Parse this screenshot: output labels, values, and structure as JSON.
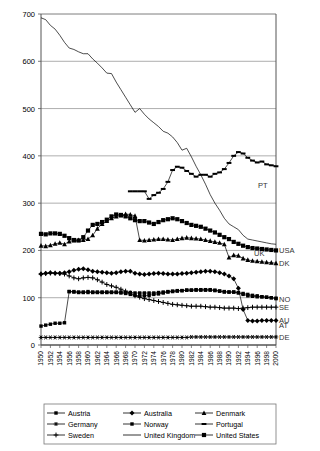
{
  "chart_data": {
    "type": "line",
    "title": "",
    "xlabel": "",
    "ylabel": "",
    "xlim": [
      1950,
      2000
    ],
    "ylim": [
      0,
      700
    ],
    "yticks": [
      0,
      100,
      200,
      300,
      400,
      500,
      600,
      700
    ],
    "ytick_labels": [
      "0",
      "100",
      "200",
      "300",
      "400",
      "500",
      "600",
      "700"
    ],
    "grid": "horizontal",
    "legend_position": "bottom",
    "xticks": [
      1950,
      1952,
      1954,
      1956,
      1958,
      1960,
      1962,
      1964,
      1966,
      1968,
      1970,
      1972,
      1974,
      1976,
      1978,
      1980,
      1982,
      1984,
      1986,
      1988,
      1990,
      1992,
      1994,
      1996,
      1998,
      2000
    ],
    "xtick_labels": [
      "1950",
      "1952",
      "1954",
      "1956",
      "1958",
      "1960",
      "1962",
      "1964",
      "1966",
      "1968",
      "1970",
      "1972",
      "1974",
      "1976",
      "1978",
      "1980",
      "1982",
      "1984",
      "1986",
      "1988",
      "1990",
      "1992",
      "1994",
      "1996",
      "1998",
      "2000"
    ],
    "x": [
      1950,
      1951,
      1952,
      1953,
      1954,
      1955,
      1956,
      1957,
      1958,
      1959,
      1960,
      1961,
      1962,
      1963,
      1964,
      1965,
      1966,
      1967,
      1968,
      1969,
      1970,
      1971,
      1972,
      1973,
      1974,
      1975,
      1976,
      1977,
      1978,
      1979,
      1980,
      1981,
      1982,
      1983,
      1984,
      1985,
      1986,
      1987,
      1988,
      1989,
      1990,
      1991,
      1992,
      1993,
      1994,
      1995,
      1996,
      1997,
      1998,
      1999,
      2000
    ],
    "end_labels": [
      {
        "code": "PT",
        "series": "Portugal",
        "value": 378
      },
      {
        "code": "UK",
        "series": "United Kingdom",
        "value": 213
      },
      {
        "code": "USA",
        "series": "United States",
        "value": 200
      },
      {
        "code": "DK",
        "series": "Denmark",
        "value": 173
      },
      {
        "code": "NO",
        "series": "Norway",
        "value": 98
      },
      {
        "code": "SE",
        "series": "Sweden",
        "value": 80
      },
      {
        "code": "AU",
        "series": "Australia",
        "value": 52
      },
      {
        "code": "AT",
        "series": "Austria",
        "value": 43
      },
      {
        "code": "DE",
        "series": "Germany",
        "value": 17
      }
    ],
    "series": [
      {
        "name": "Austria",
        "code": "AT",
        "marker": "square-small",
        "values": [
          40,
          42,
          44,
          46,
          46,
          47,
          113,
          113,
          112,
          112,
          113,
          112,
          112,
          112,
          112,
          112,
          112,
          112,
          111,
          111,
          110,
          110,
          110,
          110,
          110,
          111,
          112,
          113,
          114,
          115,
          115,
          116,
          116,
          116,
          116,
          116,
          116,
          115,
          114,
          113,
          112,
          112,
          110,
          107,
          104,
          103,
          102,
          102,
          101,
          100,
          99
        ]
      },
      {
        "name": "Australia",
        "code": "AU",
        "marker": "diamond",
        "values": [
          150,
          152,
          153,
          152,
          152,
          153,
          155,
          158,
          160,
          161,
          159,
          156,
          155,
          154,
          153,
          152,
          153,
          155,
          156,
          156,
          152,
          150,
          149,
          150,
          151,
          152,
          151,
          150,
          150,
          150,
          151,
          152,
          153,
          154,
          155,
          156,
          156,
          155,
          153,
          150,
          146,
          140,
          120,
          75,
          52,
          51,
          51,
          52,
          52,
          52,
          52
        ]
      },
      {
        "name": "Denmark",
        "code": "DK",
        "marker": "triangle",
        "values": [
          210,
          209,
          211,
          214,
          216,
          213,
          219,
          221,
          222,
          222,
          224,
          232,
          246,
          256,
          262,
          268,
          272,
          274,
          277,
          276,
          273,
          222,
          221,
          222,
          223,
          224,
          224,
          223,
          222,
          224,
          226,
          227,
          226,
          225,
          224,
          222,
          220,
          218,
          216,
          213,
          185,
          190,
          189,
          183,
          180,
          178,
          177,
          176,
          175,
          174,
          173
        ]
      },
      {
        "name": "Germany",
        "code": "DE",
        "marker": "star",
        "values": [
          16,
          16,
          16,
          16,
          16,
          16,
          16,
          16,
          16,
          16,
          16,
          16,
          16,
          16,
          16,
          16,
          16,
          16,
          16,
          16,
          16,
          16,
          16,
          16,
          16,
          16,
          16,
          16,
          16,
          16,
          16,
          16,
          17,
          17,
          17,
          17,
          17,
          17,
          17,
          17,
          17,
          17,
          17,
          17,
          17,
          17,
          17,
          17,
          17,
          17,
          17
        ]
      },
      {
        "name": "Norway",
        "code": "NO",
        "marker": "square-small",
        "values": [
          null,
          null,
          null,
          null,
          null,
          null,
          113,
          112,
          111,
          111,
          111,
          111,
          111,
          111,
          111,
          111,
          111,
          110,
          109,
          107,
          105,
          104,
          104,
          105,
          107,
          108,
          110,
          112,
          113,
          114,
          115,
          116,
          116,
          117,
          117,
          117,
          117,
          116,
          114,
          112,
          112,
          112,
          111,
          109,
          107,
          105,
          104,
          102,
          101,
          100,
          98
        ]
      },
      {
        "name": "Portugal",
        "code": "PT",
        "marker": "dash",
        "values": [
          null,
          null,
          null,
          null,
          null,
          null,
          null,
          null,
          null,
          null,
          null,
          null,
          null,
          null,
          null,
          null,
          null,
          null,
          null,
          325,
          325,
          325,
          325,
          309,
          317,
          322,
          330,
          345,
          370,
          377,
          375,
          368,
          362,
          356,
          360,
          360,
          356,
          362,
          365,
          372,
          385,
          400,
          408,
          405,
          396,
          390,
          386,
          388,
          382,
          380,
          378
        ]
      },
      {
        "name": "Sweden",
        "code": "SE",
        "marker": "plus",
        "values": [
          150,
          151,
          152,
          152,
          151,
          150,
          146,
          142,
          140,
          142,
          143,
          142,
          138,
          133,
          128,
          125,
          122,
          118,
          114,
          110,
          104,
          101,
          98,
          96,
          94,
          92,
          90,
          88,
          86,
          85,
          84,
          83,
          82,
          82,
          82,
          81,
          80,
          80,
          79,
          78,
          78,
          78,
          77,
          78,
          79,
          80,
          80,
          80,
          80,
          80,
          80
        ]
      },
      {
        "name": "United Kingdom",
        "code": "UK",
        "marker": "none",
        "values": [
          692,
          688,
          676,
          668,
          655,
          640,
          628,
          625,
          620,
          616,
          616,
          605,
          596,
          586,
          575,
          574,
          556,
          540,
          524,
          508,
          492,
          500,
          488,
          478,
          470,
          462,
          452,
          448,
          440,
          428,
          412,
          416,
          398,
          378,
          360,
          340,
          318,
          300,
          285,
          268,
          256,
          250,
          244,
          232,
          224,
          222,
          220,
          218,
          216,
          214,
          213
        ]
      },
      {
        "name": "United States",
        "code": "USA",
        "marker": "square-filled",
        "values": [
          235,
          234,
          236,
          236,
          235,
          231,
          226,
          222,
          221,
          228,
          242,
          254,
          256,
          260,
          265,
          272,
          276,
          275,
          272,
          268,
          264,
          262,
          262,
          259,
          256,
          260,
          264,
          266,
          268,
          266,
          262,
          258,
          254,
          252,
          250,
          246,
          242,
          238,
          233,
          228,
          224,
          218,
          214,
          210,
          207,
          205,
          204,
          203,
          202,
          201,
          200
        ]
      }
    ]
  },
  "legend": {
    "items": [
      {
        "label": "Austria",
        "marker": "square-small"
      },
      {
        "label": "Australia",
        "marker": "diamond"
      },
      {
        "label": "Denmark",
        "marker": "triangle"
      },
      {
        "label": "Germany",
        "marker": "star"
      },
      {
        "label": "Norway",
        "marker": "square-small"
      },
      {
        "label": "Portugal",
        "marker": "dash"
      },
      {
        "label": "Sweden",
        "marker": "plus"
      },
      {
        "label": "United Kingdom",
        "marker": "none"
      },
      {
        "label": "United States",
        "marker": "square-filled"
      }
    ]
  },
  "colors": {
    "line": "#000000",
    "grid": "#999999",
    "axis": "#555555",
    "background": "#ffffff"
  }
}
